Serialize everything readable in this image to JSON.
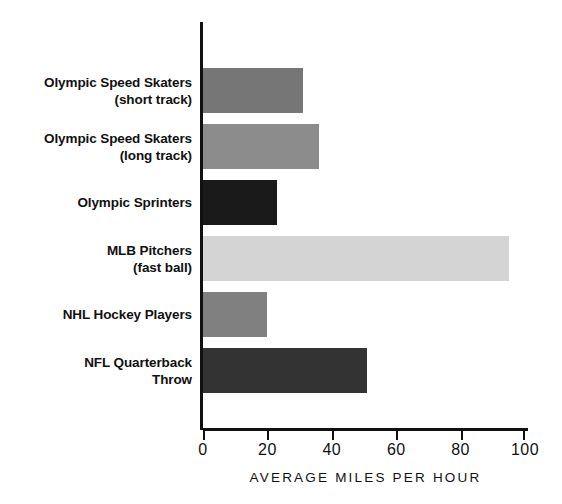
{
  "chart_data": {
    "type": "bar",
    "orientation": "horizontal",
    "title": "",
    "xlabel": "AVERAGE MILES PER HOUR",
    "ylabel": "",
    "xlim": [
      0,
      100
    ],
    "xticks": [
      "0",
      "20",
      "40",
      "60",
      "80",
      "100"
    ],
    "xtick_values": [
      0,
      20,
      40,
      60,
      80,
      100
    ],
    "grid": false,
    "legend": false,
    "categories": [
      "Olympic Speed Skaters\n(short track)",
      "Olympic Speed Skaters\n(long track)",
      "Olympic Sprinters",
      "MLB Pitchers\n(fast ball)",
      "NHL Hockey Players",
      "NFL Quarterback\nThrow"
    ],
    "values": [
      31,
      36,
      23,
      95,
      20,
      51
    ],
    "bar_colors": [
      "#767676",
      "#8c8c8c",
      "#1a1a1a",
      "#d4d4d4",
      "#808080",
      "#333333"
    ],
    "series": [
      {
        "name": "Average miles per hour",
        "values": [
          31,
          36,
          23,
          95,
          20,
          51
        ]
      }
    ],
    "axis_color": "#111111",
    "background": "#ffffff"
  }
}
